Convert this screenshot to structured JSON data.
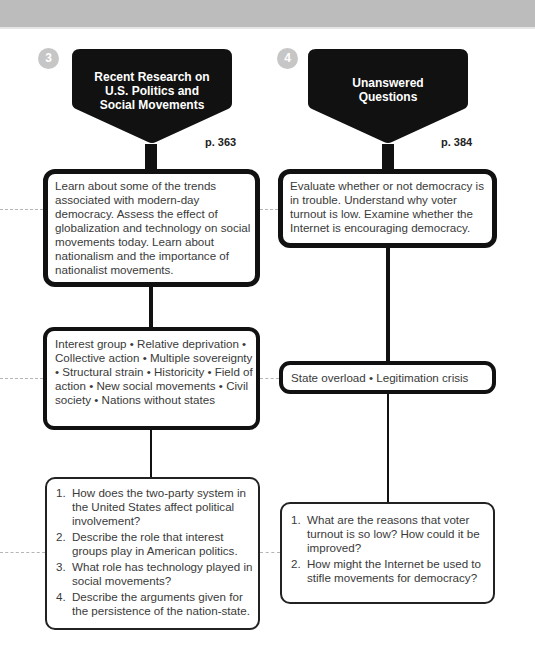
{
  "colors": {
    "top_band": "#bcbcbc",
    "badge": "#c6c6c6",
    "header_fill": "#111111",
    "header_text": "#ffffff",
    "border": "#111111",
    "dashed": "#b5b5b5",
    "body_text": "#3a3a3a"
  },
  "columns": [
    {
      "number": "3",
      "title_lines": [
        "Recent Research on",
        "U.S. Politics and",
        "Social Movements"
      ],
      "page_ref": "p. 363",
      "objectives": "Learn about some of the trends associated with modern-day democracy. Assess the effect of globalization and technology on social movements today. Learn about nationalism and the importance of nationalist movements.",
      "key_terms": "Interest group • Relative deprivation • Collective action • Multiple sovereignty • Structural strain • Historicity • Field of action • New social movements • Civil society • Nations without states",
      "questions": [
        {
          "num": "1.",
          "text": "How does the two-party system in the United States affect political involvement?"
        },
        {
          "num": "2.",
          "text": "Describe the role that interest groups play in American politics."
        },
        {
          "num": "3.",
          "text": "What role has technology played in social movements?"
        },
        {
          "num": "4.",
          "text": "Describe the arguments given for the persistence of the nation-state."
        }
      ]
    },
    {
      "number": "4",
      "title_lines": [
        "Unanswered",
        "Questions"
      ],
      "page_ref": "p. 384",
      "objectives": "Evaluate whether or not democracy is in trouble. Understand why voter turnout is low. Examine whether the Internet is encouraging democracy.",
      "key_terms": "State overload • Legitimation crisis",
      "questions": [
        {
          "num": "1.",
          "text": "What are the reasons that voter turnout is so low? How could it be improved?"
        },
        {
          "num": "2.",
          "text": "How might the Internet be used to stifle movements for democracy?"
        }
      ]
    }
  ]
}
